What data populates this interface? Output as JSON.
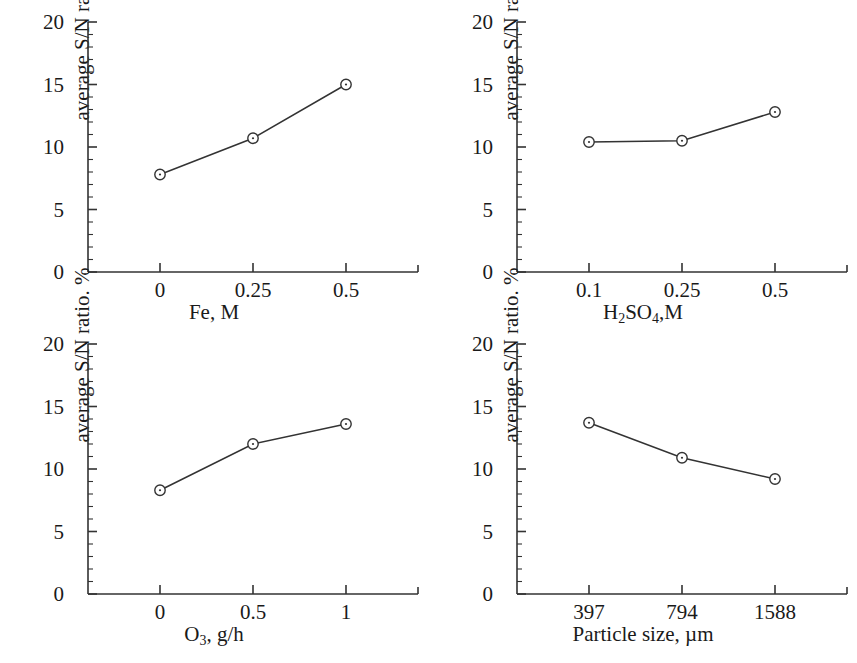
{
  "figure": {
    "ylabel": "average S/N ratio. %",
    "yticks": [
      "0",
      "5",
      "10",
      "15",
      "20"
    ],
    "ytick_values": [
      0,
      5,
      10,
      15,
      20
    ],
    "caption_fragment": ""
  },
  "chart_data": [
    {
      "type": "line",
      "panel": "top-left",
      "title": "",
      "xlabel": "Fe, M",
      "ylabel": "average S/N ratio. %",
      "categories": [
        "0",
        "0.25",
        "0.5"
      ],
      "values": [
        7.8,
        10.7,
        15.0
      ],
      "ylim": [
        0,
        20
      ],
      "yticks": [
        0,
        5,
        10,
        15,
        20
      ],
      "minor_tick_step": 1,
      "grid": false,
      "legend": "none",
      "marker": "open-circle"
    },
    {
      "type": "line",
      "panel": "top-right",
      "title": "",
      "xlabel": "H2SO4,M",
      "xlabel_parts": [
        {
          "t": "H",
          "sub": false
        },
        {
          "t": "2",
          "sub": true
        },
        {
          "t": "SO",
          "sub": false
        },
        {
          "t": "4",
          "sub": true
        },
        {
          "t": ",M",
          "sub": false
        }
      ],
      "ylabel": "average S/N ratio. %",
      "categories": [
        "0.1",
        "0.25",
        "0.5"
      ],
      "values": [
        10.4,
        10.5,
        12.8
      ],
      "ylim": [
        0,
        20
      ],
      "yticks": [
        0,
        5,
        10,
        15,
        20
      ],
      "minor_tick_step": 1,
      "grid": false,
      "legend": "none",
      "marker": "open-circle"
    },
    {
      "type": "line",
      "panel": "bottom-left",
      "title": "",
      "xlabel": "O3, g/h",
      "xlabel_parts": [
        {
          "t": "O",
          "sub": false
        },
        {
          "t": "3",
          "sub": true
        },
        {
          "t": ", g/h",
          "sub": false
        }
      ],
      "ylabel": "average S/N ratio. %",
      "categories": [
        "0",
        "0.5",
        "1"
      ],
      "values": [
        8.3,
        12.0,
        13.6
      ],
      "ylim": [
        0,
        20
      ],
      "yticks": [
        0,
        5,
        10,
        15,
        20
      ],
      "minor_tick_step": 1,
      "grid": false,
      "legend": "none",
      "marker": "open-circle"
    },
    {
      "type": "line",
      "panel": "bottom-right",
      "title": "",
      "xlabel": "Particle size, µm",
      "ylabel": "average S/N ratio. %",
      "categories": [
        "397",
        "794",
        "1588"
      ],
      "values": [
        13.7,
        10.9,
        9.2
      ],
      "ylim": [
        0,
        20
      ],
      "yticks": [
        0,
        5,
        10,
        15,
        20
      ],
      "minor_tick_step": 1,
      "grid": false,
      "legend": "none",
      "marker": "open-circle"
    }
  ]
}
